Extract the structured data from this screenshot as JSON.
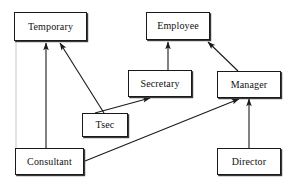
{
  "diagram": {
    "type": "inheritance-diagram",
    "canvas": {
      "width": 294,
      "height": 184
    },
    "style": {
      "background_color": "#ffffff",
      "node_fill": "#ffffff",
      "node_border_color": "#1a1a1a",
      "node_shadow_color": "#3a3a3a",
      "edge_color": "#1a1a1a",
      "text_color": "#101010",
      "guide_color": "#c8c8c8"
    },
    "nodes": [
      {
        "id": "temporary",
        "label": "Temporary",
        "x": 14,
        "y": 12,
        "w": 73,
        "h": 29
      },
      {
        "id": "employee",
        "label": "Employee",
        "x": 146,
        "y": 12,
        "w": 64,
        "h": 28
      },
      {
        "id": "secretary",
        "label": "Secretary",
        "x": 128,
        "y": 70,
        "w": 64,
        "h": 27
      },
      {
        "id": "manager",
        "label": "Manager",
        "x": 217,
        "y": 71,
        "w": 64,
        "h": 27
      },
      {
        "id": "tsec",
        "label": "Tsec",
        "x": 82,
        "y": 113,
        "w": 46,
        "h": 24
      },
      {
        "id": "consultant",
        "label": "Consultant",
        "x": 15,
        "y": 148,
        "w": 69,
        "h": 27
      },
      {
        "id": "director",
        "label": "Director",
        "x": 217,
        "y": 148,
        "w": 64,
        "h": 27
      }
    ],
    "edges": [
      {
        "id": "consultant-to-temporary",
        "from": "consultant",
        "to": "temporary",
        "x1": 46,
        "y1": 148,
        "x2": 46,
        "y2": 43,
        "arrow": "end"
      },
      {
        "id": "tsec-to-temporary",
        "from": "tsec",
        "to": "temporary",
        "x1": 104,
        "y1": 113,
        "x2": 60,
        "y2": 43,
        "arrow": "end"
      },
      {
        "id": "tsec-to-secretary",
        "from": "tsec",
        "to": "secretary",
        "x1": 95,
        "y1": 113,
        "x2": 150,
        "y2": 98,
        "arrow": "end"
      },
      {
        "id": "secretary-to-employee",
        "from": "secretary",
        "to": "employee",
        "x1": 168,
        "y1": 70,
        "x2": 168,
        "y2": 42,
        "arrow": "end"
      },
      {
        "id": "manager-to-employee",
        "from": "manager",
        "to": "employee",
        "x1": 238,
        "y1": 71,
        "x2": 208,
        "y2": 42,
        "arrow": "end"
      },
      {
        "id": "consultant-to-manager",
        "from": "consultant",
        "to": "manager",
        "x1": 85,
        "y1": 161,
        "x2": 239,
        "y2": 99,
        "arrow": "end"
      },
      {
        "id": "director-to-manager",
        "from": "director",
        "to": "manager",
        "x1": 249,
        "y1": 148,
        "x2": 249,
        "y2": 99,
        "arrow": "end"
      }
    ],
    "guides": [
      {
        "id": "temporary-consultant-guide",
        "x1": 16,
        "y1": 41,
        "x2": 16,
        "y2": 149
      }
    ]
  }
}
